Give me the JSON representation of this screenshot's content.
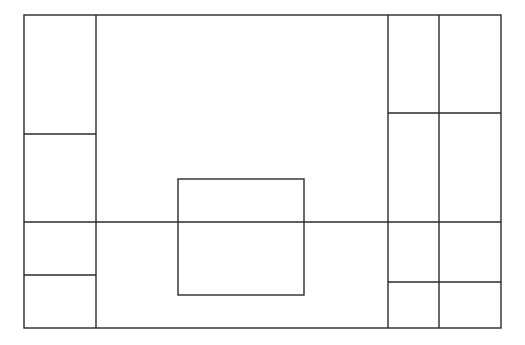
{
  "canvas": {
    "width": 525,
    "height": 345,
    "background": "#ffffff",
    "stroke": "#2a2a2a"
  },
  "diagram": {
    "outer": {
      "x": 24,
      "y": 15,
      "w": 477,
      "h": 313
    },
    "vertical_lines": [
      {
        "name": "left-column-divider",
        "x": 96,
        "y1": 15,
        "y2": 328
      },
      {
        "name": "right-column-divider-1",
        "x": 388,
        "y1": 15,
        "y2": 328
      },
      {
        "name": "right-column-divider-2",
        "x": 439,
        "y1": 15,
        "y2": 328
      }
    ],
    "horizontal_lines": [
      {
        "name": "left-upper-divider",
        "y": 134,
        "x1": 24,
        "x2": 96
      },
      {
        "name": "main-horizontal-divider",
        "y": 222,
        "x1": 24,
        "x2": 501
      },
      {
        "name": "left-lower-divider",
        "y": 275,
        "x1": 24,
        "x2": 96
      },
      {
        "name": "right-upper-divider",
        "y": 113,
        "x1": 388,
        "x2": 501
      },
      {
        "name": "right-lower-divider",
        "y": 282,
        "x1": 388,
        "x2": 501
      }
    ],
    "inner_rect": {
      "x": 178,
      "y": 179,
      "w": 126,
      "h": 116
    }
  }
}
